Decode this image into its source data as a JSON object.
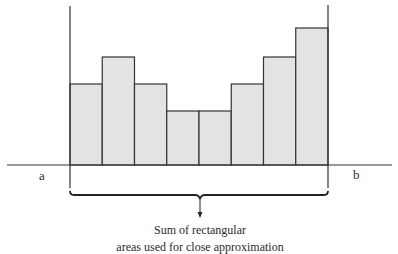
{
  "diagram": {
    "labels": {
      "left_bound": "a",
      "right_bound": "b"
    },
    "caption": {
      "line1": "Sum of rectangular",
      "line2": "areas used for close approximation"
    },
    "colors": {
      "bar_fill": "#e3e3e3",
      "stroke": "#333333",
      "background": "#ffffff"
    },
    "rectangles": [
      {
        "index": 1,
        "relative_height": 81
      },
      {
        "index": 2,
        "relative_height": 108
      },
      {
        "index": 3,
        "relative_height": 81
      },
      {
        "index": 4,
        "relative_height": 54
      },
      {
        "index": 5,
        "relative_height": 54
      },
      {
        "index": 6,
        "relative_height": 81
      },
      {
        "index": 7,
        "relative_height": 108
      },
      {
        "index": 8,
        "relative_height": 137
      }
    ]
  }
}
